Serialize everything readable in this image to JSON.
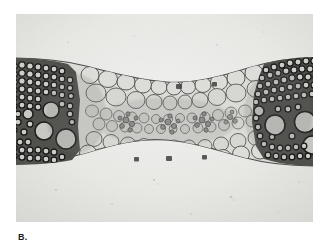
{
  "page": {
    "background_color": "#ffffff",
    "width": 328,
    "height": 251
  },
  "figure": {
    "label": "B.",
    "kind": "light-micrograph",
    "modality": "grayscale transmitted-light photomicrograph",
    "plate": {
      "x": 16,
      "y": 14,
      "width": 297,
      "height": 208,
      "background_color": "#e9e9e7",
      "vignette_color": "#d9d9d6",
      "border": "none"
    },
    "tissue": {
      "outline_color": "#3a3a3a",
      "cell_wall_color": "#4a4a4a",
      "lumen_color": "#d2d2ce",
      "sclerenchyma_color": "#2a2a2a",
      "description": "dumbbell-shaped section, thick at both ends, narrow waist at center",
      "regions": [
        {
          "name": "left-vascular-bundle",
          "type": "sclerenchyma-and-xylem",
          "center_x": 48,
          "center_y": 112,
          "tone": "dark"
        },
        {
          "name": "left-parenchyma",
          "type": "parenchyma",
          "center_x": 95,
          "center_y": 105,
          "tone": "light"
        },
        {
          "name": "central-midrib-bundles",
          "type": "minor-vascular-bundles",
          "center_x": 165,
          "center_y": 110,
          "tone": "medium"
        },
        {
          "name": "right-parenchyma",
          "type": "parenchyma",
          "center_x": 225,
          "center_y": 108,
          "tone": "light"
        },
        {
          "name": "right-vascular-bundle",
          "type": "sclerenchyma-and-xylem",
          "center_x": 278,
          "center_y": 110,
          "tone": "dark"
        }
      ]
    }
  }
}
